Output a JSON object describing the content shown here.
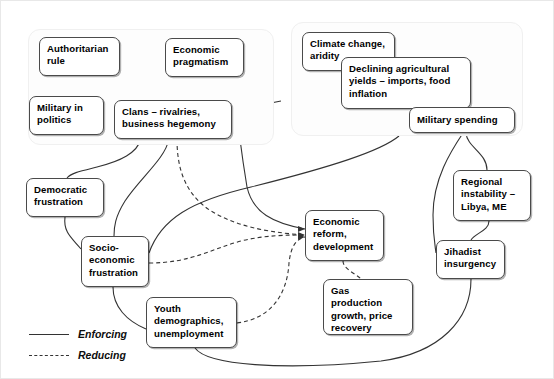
{
  "diagram": {
    "groups": [
      {
        "id": "regime-group",
        "name": "political-economic-cluster"
      },
      {
        "id": "climate-group",
        "name": "climate-security-cluster"
      }
    ],
    "nodes": [
      {
        "id": "authoritarian-rule",
        "label": "Authoritarian\nrule",
        "x": 38,
        "y": 36,
        "w": 81,
        "h": 39
      },
      {
        "id": "economic-pragmatism",
        "label": "Economic\npragmatism",
        "x": 164,
        "y": 37,
        "w": 79,
        "h": 39
      },
      {
        "id": "military-in-politics",
        "label": "Military in\npolitics",
        "x": 28,
        "y": 95,
        "w": 75,
        "h": 39
      },
      {
        "id": "clans-rivalries",
        "label": "Clans – rivalries,\nbusiness hegemony",
        "x": 113,
        "y": 99,
        "w": 118,
        "h": 39
      },
      {
        "id": "climate-change-aridity",
        "label": "Climate change,\naridity",
        "x": 301,
        "y": 31,
        "w": 93,
        "h": 39
      },
      {
        "id": "declining-yields",
        "label": "Declining agricultural\nyields – imports, food\ninflation",
        "x": 340,
        "y": 56,
        "w": 130,
        "h": 52
      },
      {
        "id": "military-spending",
        "label": "Military spending",
        "x": 408,
        "y": 106,
        "w": 106,
        "h": 26
      },
      {
        "id": "democratic-frustration",
        "label": "Democratic\nfrustration",
        "x": 25,
        "y": 177,
        "w": 78,
        "h": 39
      },
      {
        "id": "regional-instability",
        "label": "Regional\ninstability –\nLibya, ME",
        "x": 452,
        "y": 169,
        "w": 78,
        "h": 51
      },
      {
        "id": "socio-economic-frustration",
        "label": "Socio-\neconomic\nfrustration",
        "x": 80,
        "y": 235,
        "w": 68,
        "h": 51
      },
      {
        "id": "economic-reform",
        "label": "Economic\nreform,\ndevelopment",
        "x": 304,
        "y": 209,
        "w": 79,
        "h": 51
      },
      {
        "id": "jihadist-insurgency",
        "label": "Jihadist\ninsurgency",
        "x": 435,
        "y": 239,
        "w": 69,
        "h": 39
      },
      {
        "id": "gas-production",
        "label": "Gas\nproduction\ngrowth, price\nrecovery",
        "x": 322,
        "y": 278,
        "w": 90,
        "h": 56
      },
      {
        "id": "youth-demographics",
        "label": "Youth\ndemographics,\nunemployment",
        "x": 145,
        "y": 296,
        "w": 91,
        "h": 51
      }
    ],
    "legend": {
      "items": [
        {
          "id": "legend-enforcing",
          "label": "Enforcing",
          "style": "solid"
        },
        {
          "id": "legend-reducing",
          "label": "Reducing",
          "style": "dashed"
        }
      ]
    },
    "colors": {
      "node_border": "#4a4a4a",
      "node_fill": "#ffffff",
      "group_fill": "#fdfdfd",
      "group_border": "#f0f0f0",
      "edge": "#333333",
      "text": "#000000"
    },
    "edges": [
      {
        "from": "authoritarian-rule",
        "to": "military-in-politics",
        "style": "solid"
      },
      {
        "from": "authoritarian-rule",
        "to": "clans-rivalries",
        "style": "solid"
      },
      {
        "from": "economic-pragmatism",
        "to": "clans-rivalries",
        "style": "dashed"
      },
      {
        "from": "economic-pragmatism",
        "to": "economic-reform",
        "style": "solid"
      },
      {
        "from": "military-in-politics",
        "to": "clans-rivalries",
        "style": "solid"
      },
      {
        "from": "clans-rivalries",
        "to": "democratic-frustration",
        "style": "solid"
      },
      {
        "from": "clans-rivalries",
        "to": "socio-economic-frustration",
        "style": "solid"
      },
      {
        "from": "clans-rivalries",
        "to": "economic-reform",
        "style": "dashed"
      },
      {
        "from": "climate-change-aridity",
        "to": "declining-yields",
        "style": "solid"
      },
      {
        "from": "declining-yields",
        "to": "socio-economic-frustration",
        "style": "solid"
      },
      {
        "from": "military-spending",
        "to": "regional-instability",
        "style": "solid"
      },
      {
        "from": "military-spending",
        "to": "jihadist-insurgency",
        "style": "solid"
      },
      {
        "from": "regional-instability",
        "to": "jihadist-insurgency",
        "style": "solid"
      },
      {
        "from": "democratic-frustration",
        "to": "socio-economic-frustration",
        "style": "solid"
      },
      {
        "from": "socio-economic-frustration",
        "to": "youth-demographics",
        "style": "solid"
      },
      {
        "from": "socio-economic-frustration",
        "to": "economic-reform",
        "style": "dashed"
      },
      {
        "from": "youth-demographics",
        "to": "economic-reform",
        "style": "dashed"
      },
      {
        "from": "youth-demographics",
        "to": "jihadist-insurgency",
        "style": "solid"
      },
      {
        "from": "economic-reform",
        "to": "gas-production",
        "style": "dashed"
      }
    ]
  }
}
